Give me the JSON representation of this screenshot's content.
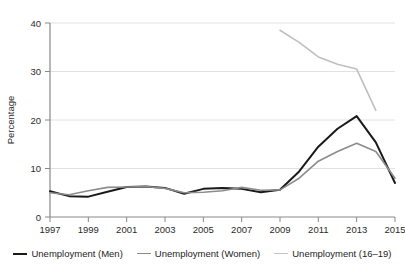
{
  "chart_data": {
    "type": "line",
    "title": "",
    "xlabel": "",
    "ylabel": "Percentage",
    "xlim": [
      1997,
      2015
    ],
    "ylim": [
      0,
      40
    ],
    "yticks": [
      0,
      10,
      20,
      30,
      40
    ],
    "ytick_labels": [
      "0",
      "10",
      "20",
      "30",
      "40"
    ],
    "xticks": [
      1997,
      1999,
      2001,
      2003,
      2005,
      2007,
      2009,
      2011,
      2013,
      2015
    ],
    "xtick_labels": [
      "1997",
      "1999",
      "2001",
      "2003",
      "2005",
      "2007",
      "2009",
      "2011",
      "2013",
      "2015"
    ],
    "grid": "horizontal",
    "legend_position": "bottom",
    "series": [
      {
        "name": "Unemployment (Men)",
        "color": "#1a1a1a",
        "width": 2.0,
        "x": [
          1997,
          1998,
          1999,
          2000,
          2001,
          2002,
          2003,
          2004,
          2005,
          2006,
          2007,
          2008,
          2009,
          2010,
          2011,
          2012,
          2013,
          2014
        ],
        "values": [
          5.3,
          4.3,
          4.2,
          5.2,
          6.2,
          6.3,
          6.0,
          4.8,
          5.8,
          6.0,
          5.8,
          5.1,
          5.6,
          9.4,
          14.5,
          18.2,
          20.8,
          15.4
        ]
      },
      {
        "name": "Unemployment (Women)",
        "color": "#8c8c8c",
        "width": 1.6,
        "x": [
          1997,
          1998,
          1999,
          2000,
          2001,
          2002,
          2003,
          2004,
          2005,
          2006,
          2007,
          2008,
          2009,
          2010,
          2011,
          2012,
          2013,
          2014
        ],
        "values": [
          5.0,
          4.6,
          5.4,
          6.1,
          6.2,
          6.3,
          5.9,
          5.0,
          5.1,
          5.4,
          6.1,
          5.5,
          5.6,
          8.0,
          11.5,
          13.5,
          15.2,
          13.5
        ]
      },
      {
        "name": "Unemployment (16–19)",
        "color": "#bfbfbf",
        "width": 1.6,
        "x": [
          2009,
          2010,
          2011,
          2012,
          2013,
          2014
        ],
        "values": [
          38.5,
          36.0,
          33.0,
          31.5,
          30.5,
          22.0
        ]
      }
    ],
    "series_tail": {
      "men": {
        "x": [
          2013,
          2014,
          2015
        ],
        "values": [
          20.8,
          15.4,
          7.0
        ]
      },
      "women": {
        "x": [
          2013,
          2014,
          2015
        ],
        "values": [
          15.2,
          13.5,
          8.0
        ]
      }
    }
  },
  "axis": {
    "y_title": "Percentage"
  },
  "legend": {
    "items": [
      {
        "label": "Unemployment (Men)",
        "color": "#1a1a1a",
        "width": "2.2px"
      },
      {
        "label": "Unemployment (Women)",
        "color": "#8c8c8c",
        "width": "1.8px"
      },
      {
        "label": "Unemployment (16–19)",
        "color": "#c4c4c4",
        "width": "1.8px"
      }
    ]
  }
}
